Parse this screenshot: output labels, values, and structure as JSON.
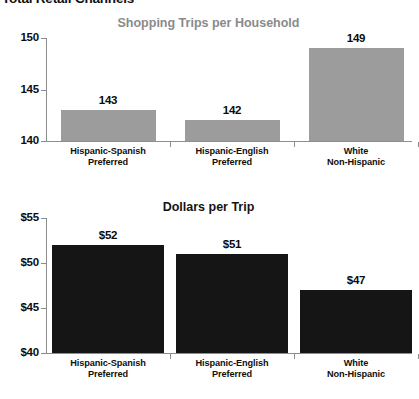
{
  "page": {
    "heading": "Total Retail Channels"
  },
  "chart_data": [
    {
      "type": "bar",
      "id": "shopping-trips",
      "title": "Shopping Trips per Household",
      "title_color": "#8a8a8a",
      "bar_color": "#9c9c9c",
      "xlabel": "",
      "ylabel": "",
      "ylim": [
        140,
        150
      ],
      "yticks": [
        140,
        145,
        150
      ],
      "ytick_labels": [
        "140",
        "145",
        "150"
      ],
      "grid": false,
      "legend": null,
      "categories": [
        "Hispanic-Spanish Preferred",
        "Hispanic-English Preferred",
        "White Non-Hispanic"
      ],
      "category_lines": [
        [
          "Hispanic-Spanish",
          "Preferred"
        ],
        [
          "Hispanic-English",
          "Preferred"
        ],
        [
          "White",
          "Non-Hispanic"
        ]
      ],
      "values": [
        143,
        142,
        149
      ],
      "value_labels": [
        "143",
        "142",
        "149"
      ]
    },
    {
      "type": "bar",
      "id": "dollars-per-trip",
      "title": "Dollars per Trip",
      "title_color": "#141414",
      "bar_color": "#151515",
      "xlabel": "",
      "ylabel": "",
      "ylim": [
        40,
        55
      ],
      "yticks": [
        40,
        45,
        50,
        55
      ],
      "ytick_labels": [
        "$40",
        "$45",
        "$50",
        "$55"
      ],
      "grid": false,
      "legend": null,
      "categories": [
        "Hispanic-Spanish Preferred",
        "Hispanic-English Preferred",
        "White Non-Hispanic"
      ],
      "category_lines": [
        [
          "Hispanic-Spanish",
          "Preferred"
        ],
        [
          "Hispanic-English",
          "Preferred"
        ],
        [
          "White",
          "Non-Hispanic"
        ]
      ],
      "values": [
        52,
        51,
        47
      ],
      "value_labels": [
        "$52",
        "$51",
        "$47"
      ]
    }
  ]
}
